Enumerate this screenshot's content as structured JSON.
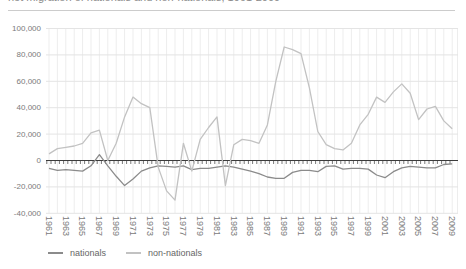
{
  "chart_data": {
    "type": "line",
    "title_clipped": "net migration of nationals and non-nationals, 1961-2009",
    "x": [
      1961,
      1962,
      1963,
      1964,
      1965,
      1966,
      1967,
      1968,
      1969,
      1970,
      1971,
      1972,
      1973,
      1974,
      1975,
      1976,
      1977,
      1978,
      1979,
      1980,
      1981,
      1982,
      1983,
      1984,
      1985,
      1986,
      1987,
      1988,
      1989,
      1990,
      1991,
      1992,
      1993,
      1994,
      1995,
      1996,
      1997,
      1998,
      1999,
      2000,
      2001,
      2002,
      2003,
      2004,
      2005,
      2006,
      2007,
      2008,
      2009
    ],
    "xtick_labels": [
      "1961",
      "1963",
      "1965",
      "1967",
      "1969",
      "1971",
      "1973",
      "1975",
      "1977",
      "1979",
      "1981",
      "1983",
      "1985",
      "1987",
      "1989",
      "1991",
      "1993",
      "1995",
      "1997",
      "1999",
      "2001",
      "2003",
      "2005",
      "2007",
      "2009"
    ],
    "series": [
      {
        "name": "nationals",
        "color": "#8b8b8b",
        "values": [
          -6000,
          -7500,
          -7000,
          -7500,
          -8000,
          -4000,
          4500,
          -4000,
          -12000,
          -19000,
          -14000,
          -8000,
          -5500,
          -4000,
          -4500,
          -5000,
          -4000,
          -7000,
          -6000,
          -6000,
          -5000,
          -4000,
          -5000,
          -6500,
          -8000,
          -10000,
          -12500,
          -13500,
          -13500,
          -9000,
          -7500,
          -7500,
          -8500,
          -4500,
          -4000,
          -6500,
          -6000,
          -6000,
          -6500,
          -11000,
          -13000,
          -8500,
          -5500,
          -4500,
          -5000,
          -5500,
          -5500,
          -3000,
          -2500
        ]
      },
      {
        "name": "non-nationals",
        "color": "#c2c2c2",
        "values": [
          5000,
          9000,
          10000,
          11000,
          13000,
          21000,
          23000,
          0,
          13000,
          33000,
          48000,
          43000,
          40000,
          -5000,
          -23000,
          -30000,
          13000,
          -8000,
          16000,
          25000,
          33000,
          -19000,
          12000,
          16000,
          15000,
          13000,
          27000,
          60000,
          86000,
          84000,
          81000,
          55000,
          22000,
          12000,
          9000,
          8000,
          13000,
          27000,
          35000,
          48000,
          44000,
          52000,
          58000,
          51000,
          31000,
          39000,
          41000,
          30000,
          24000
        ]
      }
    ],
    "ylim": [
      -40000,
      100000
    ],
    "ytick_interval": 20000,
    "ytick_labels": [
      "100,000",
      "80,000",
      "60,000",
      "40,000",
      "20,000",
      "0",
      "-20,000",
      "-40,000"
    ],
    "grid": true,
    "legend_position": "bottom-left",
    "colors": {
      "axis": "#3c3c3c",
      "h_gridline": "#e4e4e4",
      "v_gridline": "#ededed",
      "tick_label": "#7a7a7a",
      "separator": "#cccccc"
    }
  }
}
